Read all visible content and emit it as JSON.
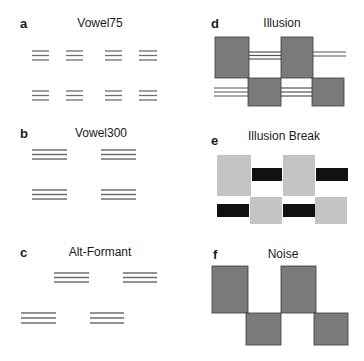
{
  "panels": [
    {
      "id": "a",
      "label": "a",
      "title": "Vowel75"
    },
    {
      "id": "b",
      "label": "b",
      "title": "Vowel300"
    },
    {
      "id": "c",
      "label": "c",
      "title": "Alt-Formant"
    },
    {
      "id": "d",
      "label": "d",
      "title": "Illusion"
    },
    {
      "id": "e",
      "label": "e",
      "title": "Illusion Break"
    },
    {
      "id": "f",
      "label": "f",
      "title": "Noise"
    }
  ],
  "colors": {
    "line": "#6e6e6e",
    "dark_square": "#7a7a7a",
    "square_border": "#3a3a3a",
    "light_square": "#c4c4c4",
    "black_bar": "#111111"
  }
}
